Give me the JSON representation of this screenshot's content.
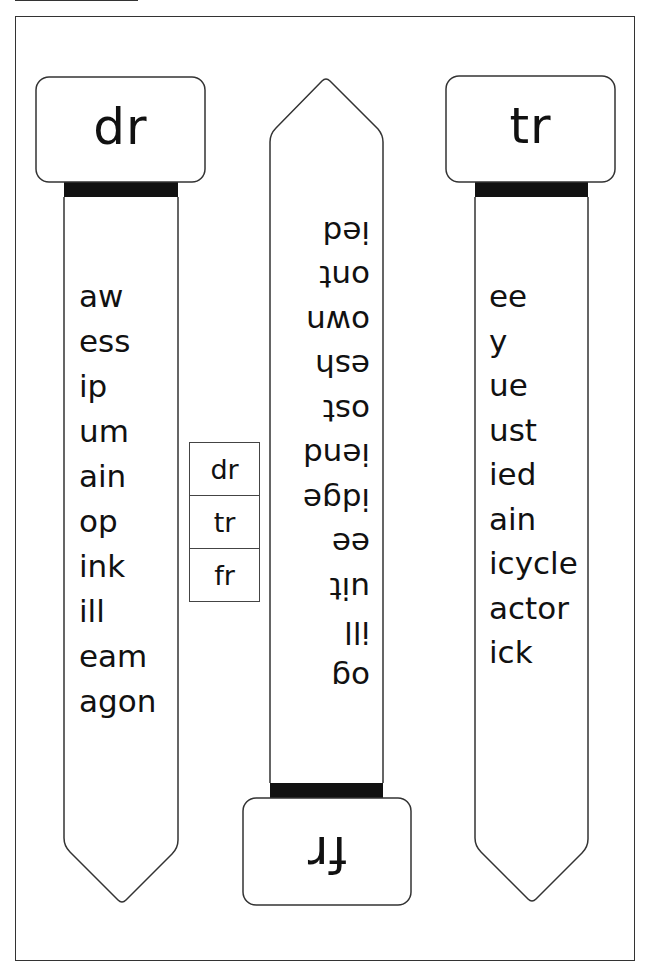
{
  "worksheet": {
    "title": "Consonant blend bookmarks: dr, tr, fr",
    "colors": {
      "stroke": "#333333",
      "bar": "#111111",
      "paper": "#ffffff",
      "text": "#111111"
    }
  },
  "strips": {
    "left": {
      "header": "dr",
      "words": [
        "aw",
        "ess",
        "ip",
        "um",
        "ain",
        "op",
        "ink",
        "ill",
        "eam",
        "agon"
      ]
    },
    "middle": {
      "header": "fr",
      "orientation": "upside-down",
      "words": [
        "og",
        "ill",
        "uit",
        "ee",
        "idge",
        "iend",
        "ost",
        "esh",
        "own",
        "ont",
        "ied"
      ]
    },
    "right": {
      "header": "tr",
      "words": [
        "ee",
        "y",
        "ue",
        "ust",
        "ied",
        "ain",
        "icycle",
        "actor",
        "ick"
      ]
    }
  },
  "blend_table": {
    "rows": [
      "dr",
      "tr",
      "fr"
    ]
  }
}
